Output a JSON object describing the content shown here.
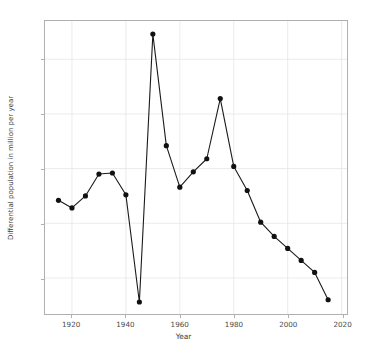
{
  "chart_data": {
    "type": "line",
    "title": "",
    "xlabel": "Year",
    "ylabel": "Differential population in million per year",
    "xlim": [
      1910,
      2022
    ],
    "ylim": [
      -0.33,
      2.35
    ],
    "xticks": [
      1920,
      1940,
      1960,
      1980,
      2000,
      2020
    ],
    "xtick_labels": [
      "1920",
      "1940",
      "1960",
      "1980",
      "2000",
      "2020"
    ],
    "yticks": [
      0.0,
      0.5,
      1.0,
      1.5,
      2.0
    ],
    "ytick_labels": [
      "0.0",
      "0.5",
      "1.0",
      "1.5",
      "2.0"
    ],
    "grid": true,
    "legend": null,
    "marker": "circle",
    "line_color": "#1a1a1a",
    "marker_color": "#111111",
    "grid_color": "#e6e6e6",
    "x": [
      1915,
      1920,
      1925,
      1930,
      1935,
      1940,
      1945,
      1950,
      1955,
      1960,
      1965,
      1970,
      1975,
      1980,
      1985,
      1990,
      1995,
      2000,
      2005,
      2010,
      2015
    ],
    "values": [
      0.71,
      0.64,
      0.75,
      0.95,
      0.96,
      0.76,
      -0.22,
      2.23,
      1.21,
      0.83,
      0.97,
      1.09,
      1.64,
      1.02,
      0.8,
      0.51,
      0.38,
      0.27,
      0.16,
      0.05,
      -0.2
    ],
    "series": [
      {
        "name": "Differential population",
        "values": [
          0.71,
          0.64,
          0.75,
          0.95,
          0.96,
          0.76,
          -0.22,
          2.23,
          1.21,
          0.83,
          0.97,
          1.09,
          1.64,
          1.02,
          0.8,
          0.51,
          0.38,
          0.27,
          0.16,
          0.05,
          -0.2
        ]
      }
    ]
  }
}
